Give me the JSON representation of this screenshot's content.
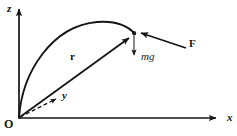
{
  "figure": {
    "background_color": "#ffffff",
    "stroke_color": "#151515",
    "width": 237,
    "height": 136
  },
  "axes": {
    "z": {
      "label": "z",
      "direction": "up",
      "style": "solid",
      "origin_px": [
        19,
        118
      ],
      "tip_px": [
        19,
        5
      ]
    },
    "x": {
      "label": "x",
      "direction": "right",
      "style": "solid",
      "origin_px": [
        19,
        118
      ],
      "tip_px": [
        222,
        118
      ]
    },
    "y": {
      "label": "y",
      "direction": "up-right-oblique",
      "style": "dashed",
      "origin_px": [
        19,
        118
      ],
      "tip_px": [
        62,
        96
      ]
    }
  },
  "origin": {
    "label": "O",
    "position_px": [
      19,
      118
    ]
  },
  "trajectory": {
    "name": "parabolic-path",
    "style": "solid-curve",
    "start_px": [
      19,
      118
    ],
    "apex_px": [
      100,
      22
    ],
    "end_px": [
      134,
      33
    ]
  },
  "particle": {
    "name": "particle",
    "position_px": [
      134,
      33
    ]
  },
  "vectors": [
    {
      "name": "position-vector",
      "label": "r",
      "label_style": "bold",
      "from_px": [
        19,
        118
      ],
      "to_px": [
        133,
        35
      ],
      "label_px": [
        72,
        56
      ]
    },
    {
      "name": "weight-vector",
      "label": "mg",
      "label_style": "italic",
      "from_px": [
        134,
        35
      ],
      "to_px": [
        134,
        60
      ],
      "label_px": [
        142,
        56
      ]
    },
    {
      "name": "applied-force-vector",
      "label": "F",
      "label_style": "bold",
      "from_px": [
        185,
        47
      ],
      "to_px": [
        137,
        32
      ],
      "label_px": [
        190,
        42
      ]
    }
  ]
}
